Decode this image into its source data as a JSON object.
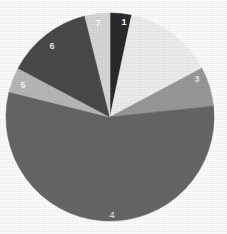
{
  "chart_data": {
    "type": "pie",
    "title": "",
    "xlabel": "",
    "ylabel": "",
    "legend": "none",
    "grid": false,
    "background_color": "#ffffff",
    "center": {
      "x": 110,
      "y": 117
    },
    "radius": 104,
    "start_angle_deg": 0,
    "direction": "clockwise",
    "total_degrees": 360,
    "categories": [
      "1",
      "2",
      "3",
      "4",
      "5",
      "6",
      "7"
    ],
    "values": [
      12,
      50,
      22,
      200,
      14,
      48,
      14
    ],
    "value_unit": "degrees",
    "percentages": [
      3.3,
      13.9,
      6.1,
      55.6,
      3.9,
      13.3,
      3.9
    ],
    "colors": [
      "#2b2b2b",
      "#f0f0f0",
      "#9a9a9a",
      "#676767",
      "#b9b9b9",
      "#4a4a4a",
      "#d9d9d9"
    ],
    "slices": [
      {
        "label": "1",
        "label_shown": true,
        "color": "#2b2b2b",
        "start_deg": 0,
        "end_deg": 12,
        "sweep_deg": 12,
        "percent": 3.3,
        "label_color": "#ffffff",
        "label_x": 124,
        "label_y": 22
      },
      {
        "label": "2",
        "label_shown": false,
        "color": "#f0f0f0",
        "start_deg": 12,
        "end_deg": 62,
        "sweep_deg": 50,
        "percent": 13.9,
        "label_color": "#8a8a8a",
        "label_x": 158,
        "label_y": 48
      },
      {
        "label": "3",
        "label_shown": true,
        "color": "#9a9a9a",
        "start_deg": 62,
        "end_deg": 84,
        "sweep_deg": 22,
        "percent": 6.1,
        "label_color": "#e8e8e8",
        "label_x": 197,
        "label_y": 79
      },
      {
        "label": "4",
        "label_shown": true,
        "color": "#676767",
        "start_deg": 84,
        "end_deg": 284,
        "sweep_deg": 200,
        "percent": 55.6,
        "label_color": "#d0d0d0",
        "label_x": 112,
        "label_y": 215
      },
      {
        "label": "5",
        "label_shown": true,
        "color": "#b9b9b9",
        "start_deg": 284,
        "end_deg": 298,
        "sweep_deg": 14,
        "percent": 3.9,
        "label_color": "#ffffff",
        "label_x": 23,
        "label_y": 85
      },
      {
        "label": "6",
        "label_shown": true,
        "color": "#4a4a4a",
        "start_deg": 298,
        "end_deg": 346,
        "sweep_deg": 48,
        "percent": 13.3,
        "label_color": "#e6e6e6",
        "label_x": 52,
        "label_y": 46
      },
      {
        "label": "7",
        "label_shown": true,
        "color": "#d9d9d9",
        "start_deg": 346,
        "end_deg": 360,
        "sweep_deg": 14,
        "percent": 3.9,
        "label_color": "#ffffff",
        "label_x": 98,
        "label_y": 23
      }
    ]
  }
}
